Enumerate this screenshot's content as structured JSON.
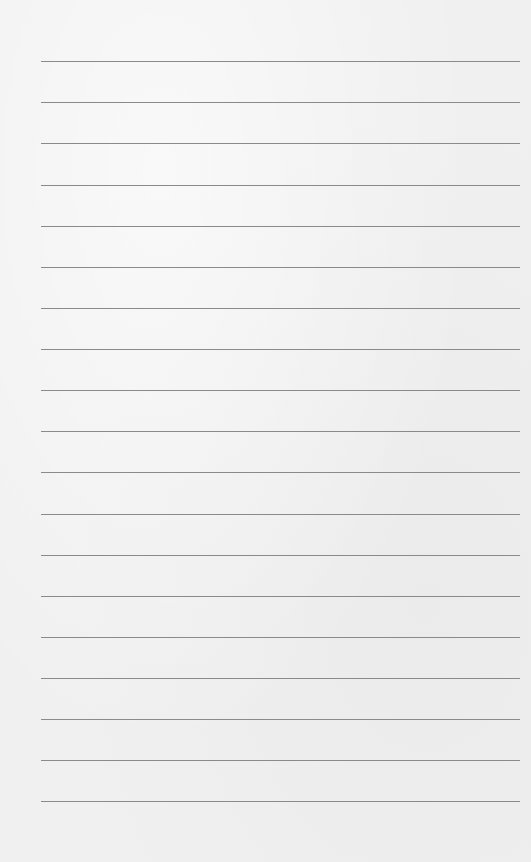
{
  "paper": {
    "type": "lined-paper",
    "line_color": "#8a8a8a",
    "background_color": "#f0f0f0",
    "line_positions": [
      61,
      102,
      143,
      185,
      226,
      267,
      308,
      349,
      390,
      431,
      472,
      514,
      555,
      596,
      637,
      678,
      719,
      760,
      801
    ]
  }
}
